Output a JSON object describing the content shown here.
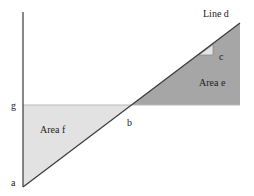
{
  "diagram": {
    "labels": {
      "line_d": "Line d",
      "c": "c",
      "area_e": "Area e",
      "area_f": "Area f",
      "g": "g",
      "b": "b",
      "a": "a"
    },
    "colors": {
      "background": "#ffffff",
      "area_f_fill": "#e2e2e2",
      "area_e_fill": "#a6a6a6",
      "triangle_c_fill": "#e4e4e4",
      "line": "#3a3a3a",
      "horizontal_g_line": "#b8b8b8",
      "text": "#222222"
    }
  }
}
